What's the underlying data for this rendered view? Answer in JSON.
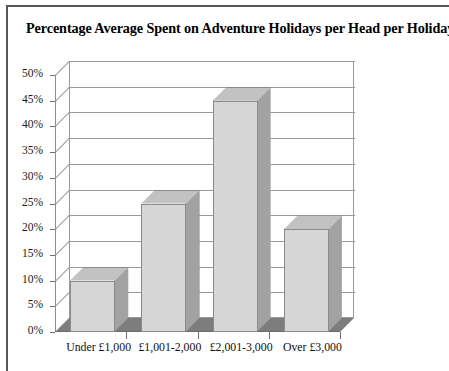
{
  "document": {
    "frame_color": "#57565a",
    "background": "#ffffff"
  },
  "chart_data": {
    "type": "bar",
    "title": "Percentage Average Spent on Adventure Holidays per Head per Holiday",
    "subtitle": "",
    "xlabel": "",
    "ylabel": "",
    "categories": [
      "Under £1,000",
      "£1,001-2,000",
      "£2,001-3,000",
      "Over £3,000"
    ],
    "values": [
      10,
      25,
      45,
      20
    ],
    "value_suffix": "%",
    "ylim": [
      0,
      50
    ],
    "ytick_step": 5,
    "ytick_labels": [
      "0%",
      "5%",
      "10%",
      "15%",
      "20%",
      "25%",
      "30%",
      "35%",
      "40%",
      "45%",
      "50%"
    ],
    "ytick_values": [
      0,
      5,
      10,
      15,
      20,
      25,
      30,
      35,
      40,
      45,
      50
    ],
    "grid": true,
    "grid_orientation": "horizontal",
    "legend": false,
    "legend_position": "none",
    "style": "3d-column",
    "colors": {
      "bar_front": "#d6d6d6",
      "bar_side": "#a2a2a2",
      "bar_top": "#c2c2c2",
      "bar_outline": "#8a8a8a",
      "gridline": "#9a9a9a",
      "floor": "#7d7d7d",
      "plot_background": "#ffffff",
      "text": "#111111"
    }
  }
}
